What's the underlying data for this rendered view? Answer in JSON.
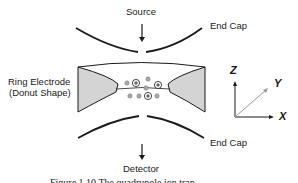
{
  "diagram": {
    "labels": {
      "source": "Source",
      "end_cap_top": "End Cap",
      "end_cap_bottom": "End Cap",
      "ring_electrode_line1": "Ring Electrode",
      "ring_electrode_line2": "(Donut Shape)",
      "detector": "Detector"
    },
    "axes": {
      "z": "Z",
      "y": "Y",
      "x": "X"
    },
    "ions": {
      "positive_symbol": "+"
    },
    "colors": {
      "electrode_fill": "#d4d4d4",
      "line": "#1a1a1a",
      "neutral_particle": "#aaaaaa",
      "axis_y": "#999999"
    },
    "caption": "Figure 1.10   The quadrupole ion trap"
  }
}
